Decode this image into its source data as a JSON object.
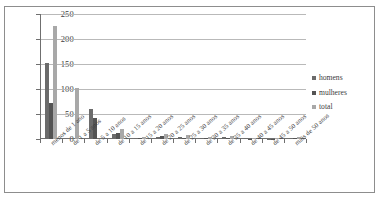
{
  "chart_data": {
    "type": "bar",
    "title": "",
    "subtitle": "",
    "xlabel": "",
    "ylabel": "",
    "ylim": [
      0,
      250
    ],
    "yticks": [
      0,
      50,
      100,
      150,
      200,
      250
    ],
    "grid": true,
    "legend_position": "right",
    "categories": [
      "menos de 1 ano",
      "de 1 a 5 anos",
      "de 5 a 10 anos",
      "de 10 a 15 anos",
      "de 15 a 20 anos",
      "de 20 a 25 anos",
      "de 25 a 30 anos",
      "de 30 a 35 anos",
      "de 35 a 40 anos",
      "de 40 a 45 anos",
      "de 45 a 50 anos",
      "mais de 50 anos"
    ],
    "series": [
      {
        "name": "homens",
        "color": "#6b6b6b",
        "values": [
          153,
          0,
          61,
          11,
          3,
          5,
          4,
          3,
          4,
          2,
          1,
          3
        ]
      },
      {
        "name": "mulheres",
        "color": "#545454",
        "values": [
          73,
          0,
          42,
          13,
          2,
          6,
          3,
          2,
          3,
          1,
          1,
          2
        ]
      },
      {
        "name": "total",
        "color": "#a8a8a8",
        "values": [
          226,
          103,
          0,
          21,
          5,
          11,
          8,
          5,
          7,
          3,
          2,
          5
        ]
      }
    ]
  },
  "legend": {
    "items": [
      {
        "label": "homens"
      },
      {
        "label": "mulheres"
      },
      {
        "label": "total"
      }
    ]
  }
}
